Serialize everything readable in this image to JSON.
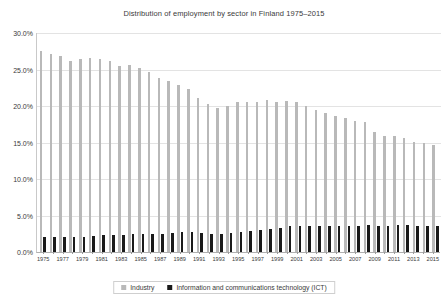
{
  "chart_data": {
    "type": "bar",
    "title": "Distribution of employment by sector in Finland 1975–2015",
    "xlabel": "",
    "ylabel": "",
    "ylim": [
      0,
      30
    ],
    "ytick_labels": [
      "0.0%",
      "5.0%",
      "10.0%",
      "15.0%",
      "20.0%",
      "25.0%",
      "30.0%"
    ],
    "ytick_values": [
      0,
      5,
      10,
      15,
      20,
      25,
      30
    ],
    "grid": true,
    "legend_position": "bottom",
    "categories": [
      "1975",
      "1976",
      "1977",
      "1978",
      "1979",
      "1980",
      "1981",
      "1982",
      "1983",
      "1984",
      "1985",
      "1986",
      "1987",
      "1988",
      "1989",
      "1990",
      "1991",
      "1992",
      "1993",
      "1994",
      "1995",
      "1996",
      "1997",
      "1998",
      "1999",
      "2000",
      "2001",
      "2002",
      "2003",
      "2004",
      "2005",
      "2006",
      "2007",
      "2008",
      "2009",
      "2010",
      "2011",
      "2012",
      "2013",
      "2014",
      "2015"
    ],
    "xtick_labels": [
      "1975",
      "",
      "1977",
      "",
      "1979",
      "",
      "1981",
      "",
      "1983",
      "",
      "1985",
      "",
      "1987",
      "",
      "1989",
      "",
      "1991",
      "",
      "1993",
      "",
      "1995",
      "",
      "1997",
      "",
      "1999",
      "",
      "2001",
      "",
      "2003",
      "",
      "2005",
      "",
      "2007",
      "",
      "2009",
      "",
      "2011",
      "",
      "2013",
      "",
      "2015"
    ],
    "series": [
      {
        "name": "Industry",
        "color": "#b9b9b9",
        "values": [
          27.5,
          27.1,
          26.8,
          26.2,
          26.4,
          26.6,
          26.5,
          26.1,
          25.5,
          25.6,
          25.2,
          24.6,
          23.9,
          23.4,
          22.9,
          22.3,
          21.1,
          20.3,
          19.7,
          20.0,
          20.5,
          20.5,
          20.6,
          20.8,
          20.6,
          20.7,
          20.5,
          20.0,
          19.5,
          19.1,
          18.6,
          18.4,
          18.0,
          17.8,
          16.4,
          15.9,
          15.9,
          15.6,
          15.1,
          14.9,
          14.6
        ]
      },
      {
        "name": "Information and communications technology (ICT)",
        "color": "#1a1a1a",
        "values": [
          2.0,
          2.1,
          2.1,
          2.0,
          2.1,
          2.2,
          2.3,
          2.3,
          2.3,
          2.4,
          2.5,
          2.5,
          2.5,
          2.6,
          2.7,
          2.7,
          2.6,
          2.5,
          2.5,
          2.6,
          2.8,
          2.9,
          3.0,
          3.2,
          3.3,
          3.5,
          3.6,
          3.6,
          3.5,
          3.5,
          3.5,
          3.6,
          3.6,
          3.7,
          3.6,
          3.6,
          3.7,
          3.7,
          3.6,
          3.6,
          3.6
        ]
      }
    ]
  },
  "legend": {
    "items": [
      {
        "label": "Industry"
      },
      {
        "label": "Information and communications technology (ICT)"
      }
    ]
  }
}
